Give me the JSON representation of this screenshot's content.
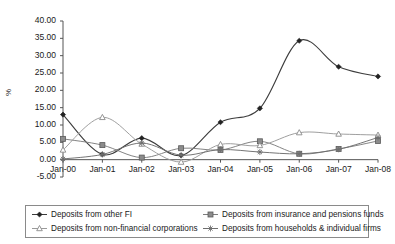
{
  "chart_data": {
    "type": "line",
    "title": "",
    "xlabel": "",
    "ylabel": "%",
    "x": [
      "Jan-00",
      "Jan-01",
      "Jan-02",
      "Jan-03",
      "Jan-04",
      "Jan-05",
      "Jan-06",
      "Jan-07",
      "Jan-08"
    ],
    "xtick_labels": [
      "Jan-00",
      "Jan-01",
      "Jan-02",
      "Jan-03",
      "Jan-04",
      "Jan-05",
      "Jan-06",
      "Jan-07",
      "Jan-08"
    ],
    "ytick_labels": [
      "40.00",
      "35.00",
      "30.00",
      "25.00",
      "20.00",
      "15.00",
      "10.00",
      "5.00",
      "0.00",
      "-5.00"
    ],
    "ytick_values": [
      40,
      35,
      30,
      25,
      20,
      15,
      10,
      5,
      0,
      -5
    ],
    "ylim": [
      -5,
      40
    ],
    "grid": false,
    "smoothed": true,
    "legend_position": "bottom",
    "series": [
      {
        "name": "Deposits from other FI",
        "marker": "filled-diamond",
        "color": "#3c3c3c",
        "values": [
          13.0,
          1.5,
          6.2,
          1.2,
          10.8,
          14.8,
          34.3,
          26.8,
          24.0
        ]
      },
      {
        "name": "Deposits from insurance and pensions funds",
        "marker": "filled-square",
        "color": "#7d7d7d",
        "values": [
          6.0,
          4.2,
          0.6,
          3.3,
          2.8,
          5.3,
          1.7,
          3.1,
          5.4
        ]
      },
      {
        "name": "Deposits from non-financial corporations",
        "marker": "open-triangle",
        "color": "#9a9a9a",
        "values": [
          2.8,
          12.2,
          4.5,
          -0.7,
          4.4,
          4.1,
          7.8,
          7.4,
          7.1
        ]
      },
      {
        "name": "Deposits from households & individual firms",
        "marker": "cross",
        "color": "#6e6e6e",
        "values": [
          0.2,
          1.5,
          4.8,
          1.3,
          2.9,
          2.2,
          1.7,
          3.0,
          6.4
        ]
      }
    ]
  },
  "legend": {
    "items": [
      {
        "label": "Deposits from other FI"
      },
      {
        "label": "Deposits from insurance and pensions funds"
      },
      {
        "label": "Deposits from non-financial corporations"
      },
      {
        "label": "Deposits from households & individual firms"
      }
    ]
  }
}
